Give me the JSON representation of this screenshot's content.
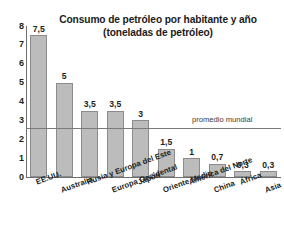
{
  "chart_data": {
    "type": "bar",
    "title": "Consumo de petróleo por habitante y año (toneladas de petróleo)",
    "title_lines": [
      "Consumo de petróleo por habitante y año",
      "(toneladas de petróleo)"
    ],
    "xlabel": "",
    "ylabel": "",
    "ylim": [
      0,
      8
    ],
    "yticks": [
      0,
      1,
      2,
      3,
      4,
      5,
      6,
      7,
      8
    ],
    "ytick_labels": [
      "0",
      "1",
      "2",
      "3",
      "4",
      "5",
      "6",
      "7",
      "8"
    ],
    "grid": false,
    "legend": false,
    "categories": [
      "EE.UU.",
      "Australia",
      "Rusia y Europa del Este",
      "Europa Occidental",
      "Japón",
      "Oriente Medio",
      "América del Norte",
      "China",
      "África",
      "Asia"
    ],
    "values": [
      7.5,
      5,
      3.5,
      3.5,
      3,
      1.5,
      1,
      0.7,
      0.3,
      0.3
    ],
    "value_labels": [
      "7,5",
      "5",
      "3,5",
      "3,5",
      "3",
      "1,5",
      "1",
      "0,7",
      "0,3",
      "0,3"
    ],
    "bar_color": "#bcbcbc",
    "bar_edge_color": "#8c8c8c",
    "annotations": [
      {
        "name": "promedio-mundial",
        "label": "promedio mundial",
        "value": 2.6,
        "type": "hline",
        "color": "#7a7a7a"
      }
    ]
  }
}
